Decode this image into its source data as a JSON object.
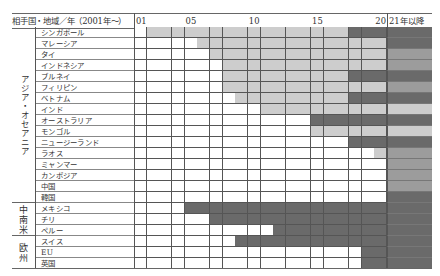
{
  "chart_data": {
    "type": "heatmap",
    "title": "",
    "header_label": "相手国・地域／年（2001年〜）",
    "year_ticks": [
      {
        "col": 0,
        "label": "01"
      },
      {
        "col": 4,
        "label": "05"
      },
      {
        "col": 9,
        "label": "10"
      },
      {
        "col": 14,
        "label": "15"
      },
      {
        "col": 19,
        "label": "20"
      }
    ],
    "years": [
      "01",
      "02",
      "03",
      "04",
      "05",
      "06",
      "07",
      "08",
      "09",
      "10",
      "11",
      "12",
      "13",
      "14",
      "15",
      "16",
      "17",
      "18",
      "19",
      "20"
    ],
    "future_column_label": "21年以降",
    "legend_levels": {
      "none": "#ffffff",
      "light": "#cdcdcd",
      "medium": "#9c9c9c",
      "dark": "#6a6a6a"
    },
    "groups": [
      {
        "name": "アジア・オセアニア",
        "rows": [
          {
            "label": "シンガポール",
            "segments": [
              {
                "from": "02",
                "to": "17",
                "level": "light"
              },
              {
                "from": "18",
                "to": "20",
                "level": "dark"
              }
            ],
            "future": "dark"
          },
          {
            "label": "マレーシア",
            "segments": [
              {
                "from": "06",
                "to": "20",
                "level": "light"
              }
            ],
            "future": "dark"
          },
          {
            "label": "タイ",
            "segments": [
              {
                "from": "07",
                "to": "20",
                "level": "light"
              }
            ],
            "future": "medium"
          },
          {
            "label": "インドネシア",
            "segments": [
              {
                "from": "08",
                "to": "20",
                "level": "light"
              }
            ],
            "future": "medium"
          },
          {
            "label": "ブルネイ",
            "segments": [
              {
                "from": "08",
                "to": "17",
                "level": "light"
              },
              {
                "from": "18",
                "to": "20",
                "level": "dark"
              }
            ],
            "future": "dark"
          },
          {
            "label": "フィリピン",
            "segments": [
              {
                "from": "08",
                "to": "20",
                "level": "light"
              }
            ],
            "future": "medium"
          },
          {
            "label": "ベトナム",
            "segments": [
              {
                "from": "09",
                "to": "17",
                "level": "light"
              },
              {
                "from": "18",
                "to": "20",
                "level": "dark"
              }
            ],
            "future": "dark"
          },
          {
            "label": "インド",
            "segments": [
              {
                "from": "11",
                "to": "20",
                "level": "light"
              }
            ],
            "future": "light"
          },
          {
            "label": "オーストラリア",
            "segments": [
              {
                "from": "15",
                "to": "20",
                "level": "dark"
              }
            ],
            "future": "dark"
          },
          {
            "label": "モンゴル",
            "segments": [
              {
                "from": "15",
                "to": "20",
                "level": "light"
              }
            ],
            "future": "light"
          },
          {
            "label": "ニュージーランド",
            "segments": [
              {
                "from": "18",
                "to": "20",
                "level": "dark"
              }
            ],
            "future": "dark"
          },
          {
            "label": "ラオス",
            "segments": [
              {
                "from": "20",
                "to": "20",
                "level": "light"
              }
            ],
            "future": "medium"
          },
          {
            "label": "ミャンマー",
            "segments": [],
            "future": "medium"
          },
          {
            "label": "カンボジア",
            "segments": [],
            "future": "medium"
          },
          {
            "label": "中国",
            "segments": [],
            "future": "medium"
          },
          {
            "label": "韓国",
            "segments": [],
            "future": "dark"
          }
        ]
      },
      {
        "name": "中南米",
        "rows": [
          {
            "label": "メキシコ",
            "segments": [
              {
                "from": "05",
                "to": "20",
                "level": "dark"
              }
            ],
            "future": "dark"
          },
          {
            "label": "チリ",
            "segments": [
              {
                "from": "07",
                "to": "20",
                "level": "dark"
              }
            ],
            "future": "dark"
          },
          {
            "label": "ペルー",
            "segments": [
              {
                "from": "12",
                "to": "20",
                "level": "dark"
              }
            ],
            "future": "dark"
          }
        ]
      },
      {
        "name": "欧州",
        "rows": [
          {
            "label": "スイス",
            "segments": [
              {
                "from": "09",
                "to": "20",
                "level": "dark"
              }
            ],
            "future": "dark"
          },
          {
            "label": "EU",
            "segments": [
              {
                "from": "19",
                "to": "20",
                "level": "dark"
              }
            ],
            "future": "dark"
          },
          {
            "label": "英国",
            "segments": [
              {
                "from": "19",
                "to": "20",
                "level": "dark"
              }
            ],
            "future": "dark"
          }
        ]
      }
    ]
  }
}
